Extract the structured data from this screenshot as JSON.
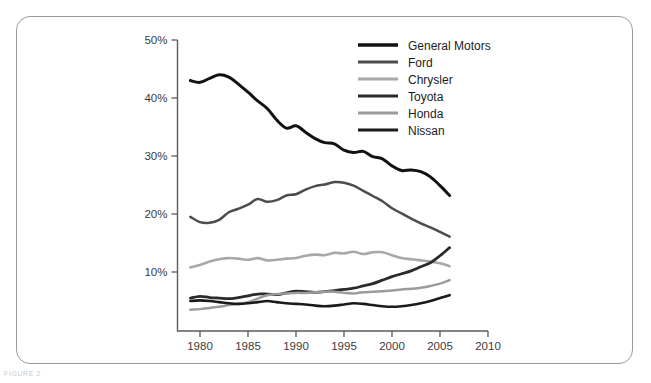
{
  "figure": {
    "caption": "FIGURE 2",
    "frame_color": "#9a9a9a",
    "background": "#ffffff"
  },
  "chart_data": {
    "type": "line",
    "title": "",
    "subtitle": "",
    "xlabel": "",
    "ylabel": "",
    "xlim": [
      1978,
      2010
    ],
    "ylim": [
      0,
      50
    ],
    "grid": false,
    "legend_position": "top-right",
    "x_ticks": [
      1980,
      1985,
      1990,
      1995,
      2000,
      2005,
      2010
    ],
    "x_tick_labels": [
      "1980",
      "1985",
      "1990",
      "1995",
      "2000",
      "2005",
      "2010"
    ],
    "y_ticks": [
      10,
      20,
      30,
      40,
      50
    ],
    "y_tick_labels": [
      "10%",
      "20%",
      "30%",
      "40%",
      "50%"
    ],
    "x": [
      1979,
      1980,
      1981,
      1982,
      1983,
      1984,
      1985,
      1986,
      1987,
      1988,
      1989,
      1990,
      1991,
      1992,
      1993,
      1994,
      1995,
      1996,
      1997,
      1998,
      1999,
      2000,
      2001,
      2002,
      2003,
      2004,
      2005,
      2006
    ],
    "series": [
      {
        "name": "General Motors",
        "color": "#111111",
        "width": 3.0,
        "values": [
          43.0,
          42.7,
          43.4,
          44.0,
          43.6,
          42.4,
          41.0,
          39.5,
          38.2,
          36.2,
          34.8,
          35.2,
          34.1,
          33.0,
          32.3,
          32.1,
          31.0,
          30.6,
          30.8,
          29.9,
          29.5,
          28.3,
          27.5,
          27.6,
          27.3,
          26.4,
          24.9,
          23.2
        ]
      },
      {
        "name": "Ford",
        "color": "#4c4c4c",
        "width": 2.5,
        "values": [
          19.5,
          18.6,
          18.5,
          19.0,
          20.3,
          20.9,
          21.6,
          22.6,
          22.1,
          22.4,
          23.2,
          23.4,
          24.2,
          24.8,
          25.1,
          25.5,
          25.4,
          24.9,
          24.0,
          23.1,
          22.2,
          21.0,
          20.1,
          19.2,
          18.4,
          17.7,
          16.9,
          16.1
        ]
      },
      {
        "name": "Chrysler",
        "color": "#a8a8a8",
        "width": 2.6,
        "values": [
          10.8,
          11.2,
          11.8,
          12.2,
          12.4,
          12.3,
          12.1,
          12.4,
          12.0,
          12.1,
          12.3,
          12.4,
          12.8,
          13.0,
          12.9,
          13.3,
          13.2,
          13.5,
          13.1,
          13.4,
          13.4,
          12.9,
          12.4,
          12.2,
          12.0,
          11.8,
          11.5,
          11.0
        ]
      },
      {
        "name": "Toyota",
        "color": "#2a2a2a",
        "width": 2.8,
        "values": [
          5.5,
          5.8,
          5.6,
          5.5,
          5.4,
          5.6,
          5.9,
          6.2,
          6.2,
          6.1,
          6.4,
          6.7,
          6.6,
          6.5,
          6.6,
          6.8,
          7.0,
          7.2,
          7.6,
          8.0,
          8.6,
          9.2,
          9.7,
          10.2,
          10.9,
          11.6,
          12.8,
          14.2
        ]
      },
      {
        "name": "Honda",
        "color": "#9b9b9b",
        "width": 2.5,
        "values": [
          3.5,
          3.6,
          3.8,
          4.0,
          4.3,
          4.5,
          4.8,
          5.4,
          6.0,
          6.2,
          6.3,
          6.4,
          6.4,
          6.5,
          6.6,
          6.6,
          6.4,
          6.3,
          6.5,
          6.6,
          6.7,
          6.8,
          7.0,
          7.1,
          7.3,
          7.6,
          8.0,
          8.6
        ]
      },
      {
        "name": "Nissan",
        "color": "#1a1a1a",
        "width": 2.6,
        "values": [
          5.0,
          5.1,
          5.0,
          4.8,
          4.6,
          4.5,
          4.6,
          4.8,
          5.0,
          4.8,
          4.6,
          4.5,
          4.4,
          4.2,
          4.1,
          4.2,
          4.4,
          4.6,
          4.5,
          4.3,
          4.1,
          4.0,
          4.1,
          4.3,
          4.6,
          5.0,
          5.5,
          6.0
        ]
      }
    ],
    "legend": [
      {
        "label": "General Motors",
        "color": "#111111",
        "width": 3.4
      },
      {
        "label": "Ford",
        "color": "#4c4c4c",
        "width": 3.0
      },
      {
        "label": "Chrysler",
        "color": "#a8a8a8",
        "width": 3.0
      },
      {
        "label": "Toyota",
        "color": "#2a2a2a",
        "width": 3.2
      },
      {
        "label": "Honda",
        "color": "#9b9b9b",
        "width": 3.0
      },
      {
        "label": "Nissan",
        "color": "#1a1a1a",
        "width": 3.2
      }
    ]
  }
}
